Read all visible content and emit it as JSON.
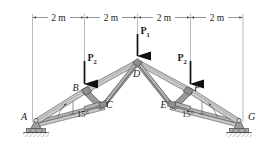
{
  "figure": {
    "dimensions": {
      "label_1": "2 m",
      "label_2": "2 m",
      "label_3": "2 m",
      "label_4": "2 m"
    },
    "joints": {
      "a": "A",
      "b": "B",
      "c": "C",
      "d": "D",
      "e": "E",
      "f": "F",
      "g": "G"
    },
    "loads": {
      "p1_symbol": "P",
      "p1_subscript": "1",
      "p2_left_symbol": "P",
      "p2_left_subscript": "2",
      "p2_right_symbol": "P",
      "p2_right_subscript": "2"
    },
    "angles": {
      "left": "15°",
      "right": "15°"
    },
    "colors": {
      "member_light": "#c9c9c9",
      "member_mid": "#b3b3b3",
      "member_dark": "#9a9a9a",
      "outline": "#3a3a3a",
      "arrow": "#111111",
      "dimension_line": "#4c4c5a",
      "extension_line": "#8a8a96",
      "support": "#8e8e8e",
      "text": "#1a1a1a"
    }
  }
}
